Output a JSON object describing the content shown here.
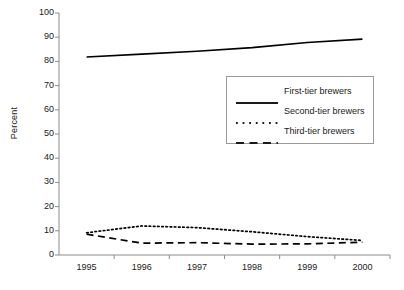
{
  "chart_data": {
    "type": "line",
    "title": "",
    "xlabel": "",
    "ylabel": "Percent",
    "x": [
      1995,
      1996,
      1997,
      1998,
      1999,
      2000
    ],
    "xtick_labels": [
      "1995",
      "1996",
      "1997",
      "1998",
      "1999",
      "2000"
    ],
    "ytick_labels": [
      "0",
      "10",
      "20",
      "30",
      "40",
      "50",
      "60",
      "70",
      "80",
      "90",
      "100"
    ],
    "ylim": [
      0,
      100
    ],
    "ytick_step": 10,
    "grid": false,
    "legend_position": "upper-center-right",
    "series": [
      {
        "name": "First-tier brewers",
        "style": "solid",
        "color": "#000000",
        "values": [
          81.8,
          83.0,
          84.2,
          85.7,
          87.8,
          89.2
        ]
      },
      {
        "name": "Second-tier brewers",
        "style": "dotted",
        "color": "#000000",
        "values": [
          9.2,
          12.0,
          11.3,
          9.6,
          7.6,
          6.0
        ]
      },
      {
        "name": "Third-tier brewers",
        "style": "dashed",
        "color": "#000000",
        "values": [
          8.6,
          4.9,
          5.1,
          4.5,
          4.6,
          5.3
        ]
      }
    ]
  },
  "axis": {
    "y_title": "Percent"
  },
  "legend": {
    "entries": [
      {
        "label": "First-tier brewers"
      },
      {
        "label": "Second-tier brewers"
      },
      {
        "label": "Third-tier brewers"
      }
    ]
  },
  "colors": {
    "axis": "#8c8c8c",
    "line": "#1a1a1a",
    "legend_border": "#9a9a9a",
    "background": "#ffffff"
  }
}
